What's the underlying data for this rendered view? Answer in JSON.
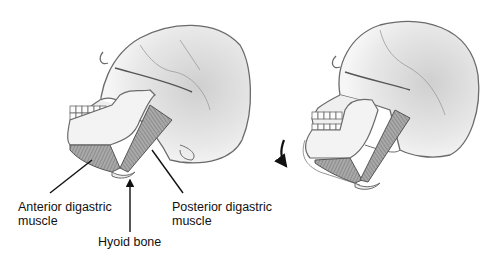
{
  "figure": {
    "panels": [
      {
        "name": "jaw-closed"
      },
      {
        "name": "jaw-open",
        "arrow": "downward curved arrow indicating jaw depression"
      }
    ]
  },
  "labels": {
    "anterior": {
      "line1": "Anterior digastric",
      "line2": "muscle"
    },
    "posterior": {
      "line1": "Posterior digastric",
      "line2": "muscle"
    },
    "hyoid": {
      "line1": "Hyoid bone"
    }
  },
  "colors": {
    "outline": "#6b6b6b",
    "shade": "#d9d9d9",
    "muscle": "#8a8a8a",
    "text": "#111111"
  }
}
